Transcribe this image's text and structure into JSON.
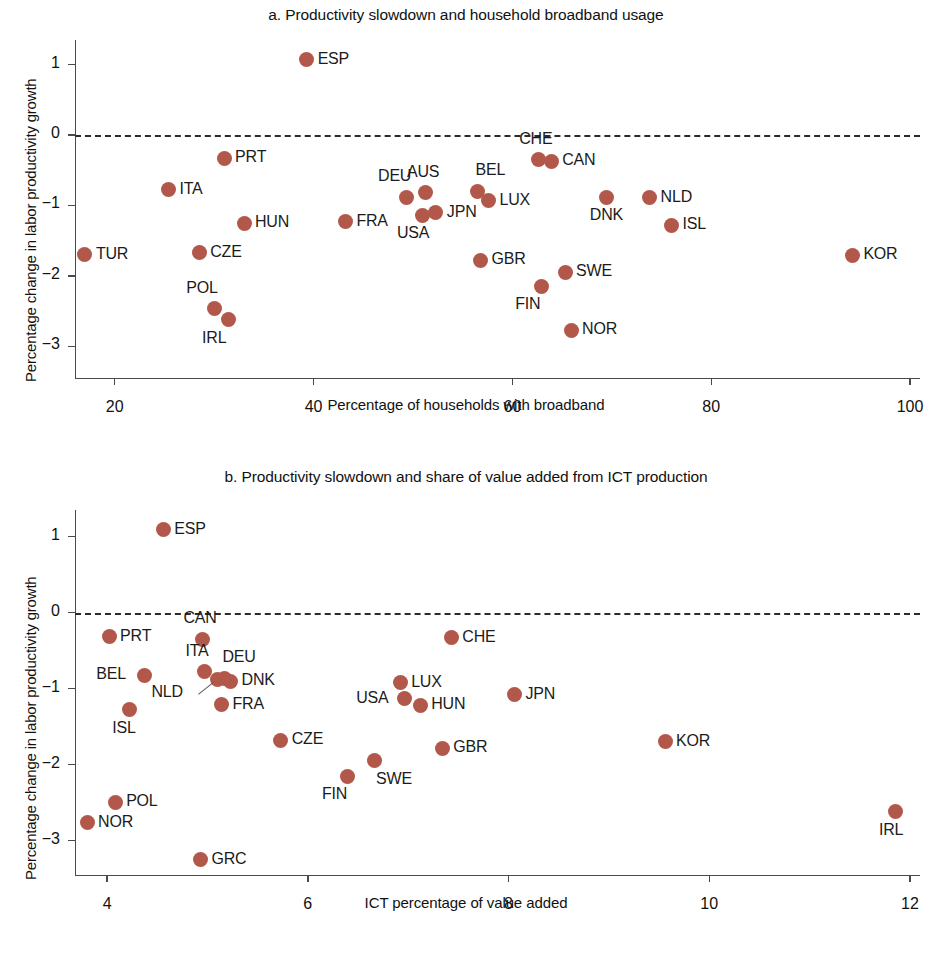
{
  "figure": {
    "dot_color": "#b2584b",
    "axis_color": "#4a4a4a"
  },
  "panel_a": {
    "title": "a. Productivity slowdown and household broadband usage",
    "ylabel": "Percentage change in labor productivity growth",
    "xlabel": "Percentage of households with broadband"
  },
  "panel_b": {
    "title": "b. Productivity slowdown and share of value added from ICT production",
    "ylabel": "Percentage change in labor productivity growth",
    "xlabel": "ICT percentage of value added"
  },
  "chart_data": [
    {
      "type": "scatter",
      "id": "panel_a",
      "title": "a. Productivity slowdown and household broadband usage",
      "xlabel": "Percentage of households with broadband",
      "ylabel": "Percentage change in labor productivity growth",
      "xlim": [
        16.0,
        101.0
      ],
      "ylim": [
        -3.45,
        1.35
      ],
      "xticks": [
        20,
        40,
        60,
        80,
        100
      ],
      "yticks": [
        1,
        0,
        -1,
        -2,
        -3
      ],
      "xtick_labels": [
        "20",
        "40",
        "60",
        "80",
        "100"
      ],
      "ytick_labels": [
        "1",
        "0",
        "−1",
        "−2",
        "−3"
      ],
      "grid": false,
      "legend": null,
      "reference_line": {
        "y": 0,
        "style": "dashed"
      },
      "points": [
        {
          "label": "TUR",
          "x": 17.0,
          "y": -1.7,
          "label_pos": "right"
        },
        {
          "label": "ITA",
          "x": 25.4,
          "y": -0.78,
          "label_pos": "right"
        },
        {
          "label": "CZE",
          "x": 28.5,
          "y": -1.67,
          "label_pos": "right"
        },
        {
          "label": "PRT",
          "x": 31.0,
          "y": -0.33,
          "label_pos": "right"
        },
        {
          "label": "POL",
          "x": 30.0,
          "y": -2.47,
          "label_pos": "above-left"
        },
        {
          "label": "IRL",
          "x": 31.4,
          "y": -2.62,
          "label_pos": "below-left"
        },
        {
          "label": "HUN",
          "x": 33.0,
          "y": -1.25,
          "label_pos": "right"
        },
        {
          "label": "ESP",
          "x": 39.3,
          "y": 1.07,
          "label_pos": "right"
        },
        {
          "label": "FRA",
          "x": 43.2,
          "y": -1.23,
          "label_pos": "right"
        },
        {
          "label": "DEU",
          "x": 49.3,
          "y": -0.88,
          "label_pos": "above-left"
        },
        {
          "label": "AUS",
          "x": 51.3,
          "y": -0.82,
          "label_pos": "above"
        },
        {
          "label": "USA",
          "x": 51.0,
          "y": -1.14,
          "label_pos": "below-left"
        },
        {
          "label": "JPN",
          "x": 52.3,
          "y": -1.1,
          "label_pos": "right"
        },
        {
          "label": "BEL",
          "x": 56.5,
          "y": -0.8,
          "label_pos": "above-right"
        },
        {
          "label": "LUX",
          "x": 57.6,
          "y": -0.93,
          "label_pos": "right"
        },
        {
          "label": "GBR",
          "x": 56.8,
          "y": -1.78,
          "label_pos": "right"
        },
        {
          "label": "CHE",
          "x": 62.6,
          "y": -0.35,
          "label_pos": "above"
        },
        {
          "label": "CAN",
          "x": 63.9,
          "y": -0.37,
          "label_pos": "right"
        },
        {
          "label": "FIN",
          "x": 62.9,
          "y": -2.15,
          "label_pos": "below-left"
        },
        {
          "label": "SWE",
          "x": 65.3,
          "y": -1.95,
          "label_pos": "right"
        },
        {
          "label": "NOR",
          "x": 65.9,
          "y": -2.77,
          "label_pos": "right"
        },
        {
          "label": "DNK",
          "x": 69.5,
          "y": -0.88,
          "label_pos": "below"
        },
        {
          "label": "NLD",
          "x": 73.8,
          "y": -0.89,
          "label_pos": "right"
        },
        {
          "label": "ISL",
          "x": 76.0,
          "y": -1.28,
          "label_pos": "right"
        },
        {
          "label": "KOR",
          "x": 94.2,
          "y": -1.71,
          "label_pos": "right"
        }
      ]
    },
    {
      "type": "scatter",
      "id": "panel_b",
      "title": "b. Productivity slowdown and share of value added from ICT production",
      "xlabel": "ICT percentage of value added",
      "ylabel": "Percentage change in labor productivity growth",
      "xlim": [
        3.68,
        12.1
      ],
      "ylim": [
        -3.45,
        1.35
      ],
      "xticks": [
        4,
        6,
        8,
        10,
        12
      ],
      "yticks": [
        1,
        0,
        -1,
        -2,
        -3
      ],
      "xtick_labels": [
        "4",
        "6",
        "8",
        "10",
        "12"
      ],
      "ytick_labels": [
        "1",
        "0",
        "−1",
        "−2",
        "−3"
      ],
      "grid": false,
      "legend": null,
      "reference_line": {
        "y": 0,
        "style": "dashed"
      },
      "points": [
        {
          "label": "NOR",
          "x": 3.8,
          "y": -2.76,
          "label_pos": "right"
        },
        {
          "label": "PRT",
          "x": 4.02,
          "y": -0.32,
          "label_pos": "right"
        },
        {
          "label": "POL",
          "x": 4.08,
          "y": -2.49,
          "label_pos": "right"
        },
        {
          "label": "ISL",
          "x": 4.22,
          "y": -1.28,
          "label_pos": "below"
        },
        {
          "label": "BEL",
          "x": 4.37,
          "y": -0.82,
          "label_pos": "left"
        },
        {
          "label": "ESP",
          "x": 4.56,
          "y": 1.09,
          "label_pos": "right"
        },
        {
          "label": "CAN",
          "x": 4.95,
          "y": -0.35,
          "label_pos": "above"
        },
        {
          "label": "GRC",
          "x": 4.93,
          "y": -3.25,
          "label_pos": "right"
        },
        {
          "label": "ITA",
          "x": 4.97,
          "y": -0.78,
          "label_pos": "above"
        },
        {
          "label": "NLD",
          "x": 5.1,
          "y": -0.88,
          "label_pos": "left-leader"
        },
        {
          "label": "DEU",
          "x": 5.17,
          "y": -0.86,
          "label_pos": "above-right"
        },
        {
          "label": "DNK",
          "x": 5.23,
          "y": -0.9,
          "label_pos": "right"
        },
        {
          "label": "FRA",
          "x": 5.14,
          "y": -1.21,
          "label_pos": "right"
        },
        {
          "label": "CZE",
          "x": 5.73,
          "y": -1.68,
          "label_pos": "right"
        },
        {
          "label": "FIN",
          "x": 6.4,
          "y": -2.15,
          "label_pos": "below-left"
        },
        {
          "label": "SWE",
          "x": 6.66,
          "y": -1.95,
          "label_pos": "below-right"
        },
        {
          "label": "USA",
          "x": 6.96,
          "y": -1.13,
          "label_pos": "left"
        },
        {
          "label": "LUX",
          "x": 6.92,
          "y": -0.92,
          "label_pos": "right"
        },
        {
          "label": "HUN",
          "x": 7.12,
          "y": -1.22,
          "label_pos": "right"
        },
        {
          "label": "GBR",
          "x": 7.34,
          "y": -1.78,
          "label_pos": "right"
        },
        {
          "label": "CHE",
          "x": 7.43,
          "y": -0.33,
          "label_pos": "right"
        },
        {
          "label": "JPN",
          "x": 8.06,
          "y": -1.08,
          "label_pos": "right"
        },
        {
          "label": "KOR",
          "x": 9.56,
          "y": -1.7,
          "label_pos": "right"
        },
        {
          "label": "IRL",
          "x": 11.86,
          "y": -2.62,
          "label_pos": "below"
        }
      ]
    }
  ]
}
